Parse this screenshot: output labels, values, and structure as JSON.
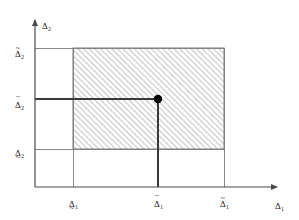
{
  "figure": {
    "type": "region-diagram",
    "background_color": "#ffffff",
    "line_color": "#555555",
    "accent_line_color": "#3a3a3a",
    "hatch_color": "#7d7d7d",
    "point_color": "#000000",
    "axes": {
      "x_label": {
        "base": "Δ",
        "sub": "1",
        "accent": "none"
      },
      "y_label": {
        "base": "Δ",
        "sub": "2",
        "accent": "none"
      },
      "origin": {
        "x": 35,
        "y": 187
      },
      "x_axis_end": {
        "x": 283,
        "y": 187
      },
      "y_axis_top": {
        "x": 35,
        "y": 14
      }
    },
    "x_ticks": [
      {
        "id": "x-lower",
        "base": "Δ",
        "sub": "1",
        "accent": "under-tilde",
        "px": 73
      },
      {
        "id": "x-hat",
        "base": "Δ",
        "sub": "1",
        "accent": "bar",
        "px": 158
      },
      {
        "id": "x-upper",
        "base": "Δ",
        "sub": "1",
        "accent": "tilde",
        "px": 224
      }
    ],
    "y_ticks": [
      {
        "id": "y-upper",
        "base": "Δ",
        "sub": "2",
        "accent": "tilde",
        "px": 48
      },
      {
        "id": "y-hat",
        "base": "Δ",
        "sub": "2",
        "accent": "bar",
        "px": 99
      },
      {
        "id": "y-lower",
        "base": "Δ",
        "sub": "2",
        "accent": "under-tilde",
        "px": 149
      }
    ],
    "hatched_region": {
      "x_from_px": 73,
      "x_to_px": 224,
      "y_top_px": 48,
      "y_bottom_px": 149,
      "hatch_angle_deg": 45,
      "hatch_spacing_px": 4
    },
    "marked_point": {
      "x_px": 158,
      "y_px": 99,
      "radius_px": 4.2,
      "x_value_label": {
        "base": "Δ",
        "sub": "1",
        "accent": "bar"
      },
      "y_value_label": {
        "base": "Δ",
        "sub": "2",
        "accent": "bar"
      }
    }
  }
}
